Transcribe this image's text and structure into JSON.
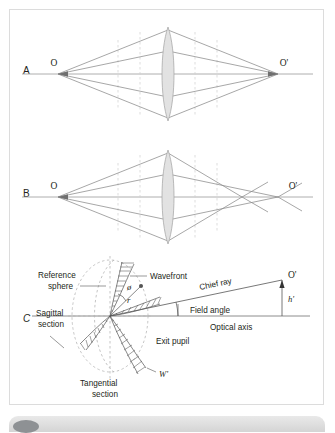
{
  "figure": {
    "panels": [
      {
        "id": "A",
        "letter": "A",
        "caption_left": "O",
        "caption_right": "O'",
        "description": "Aberration-free lens: all rays from object point O converge to a single image point O'"
      },
      {
        "id": "B",
        "letter": "B",
        "caption_left": "O",
        "caption_right": "O'",
        "description": "Lens with spherical aberration: marginal rays cross the axis before the paraxial image point O'"
      },
      {
        "id": "C",
        "letter": "C",
        "description": "Wavefront aberration at the exit pupil relative to the reference sphere",
        "labels": {
          "reference_sphere": "Reference\nsphere",
          "reference_sphere_line1": "Reference",
          "reference_sphere_line2": "sphere",
          "wavefront": "Wavefront",
          "sagittal_line1": "Sagittal",
          "sagittal_line2": "section",
          "tangential_line1": "Tangential",
          "tangential_line2": "section",
          "exit_pupil": "Exit pupil",
          "chief_ray": "Chief ray",
          "field_angle": "Field angle",
          "optical_axis": "Optical axis",
          "image_point": "O'",
          "image_height": "h'",
          "wavefront_symbol": "W'",
          "azimuth_angle": "ø",
          "radius": "r"
        }
      }
    ]
  },
  "colors": {
    "ray": "#8a8a8a",
    "axis": "#9a9a9a",
    "lens_fill": "#e2e2e2",
    "lens_stroke": "#a9a9a9",
    "dashed": "#c9c9c9",
    "text": "#231f20",
    "frame_border": "#dcdcdc",
    "bar": "#e0e0e0",
    "knob": "#8e9194"
  },
  "bottom_bar": {
    "visible": true,
    "knob": "scroll-handle"
  }
}
